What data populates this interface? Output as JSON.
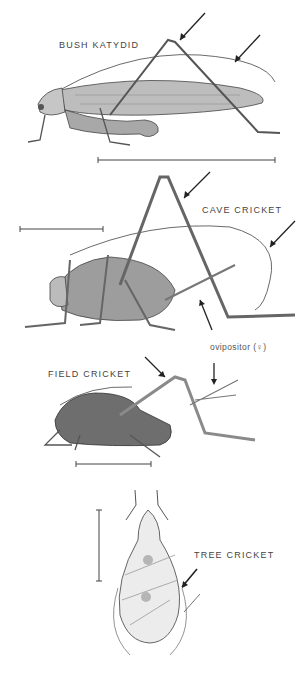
{
  "figures": [
    {
      "id": "bush-katydid",
      "label": "BUSH KATYDID"
    },
    {
      "id": "cave-cricket",
      "label": "CAVE CRICKET"
    },
    {
      "id": "field-cricket",
      "label": "FIELD CRICKET",
      "annotation": "ovipositor (♀)"
    },
    {
      "id": "tree-cricket",
      "label": "TREE CRICKET"
    }
  ],
  "colors": {
    "ink": "#333333",
    "shade": "#8a8a8a",
    "light": "#cfcfcf",
    "background": "#ffffff"
  }
}
